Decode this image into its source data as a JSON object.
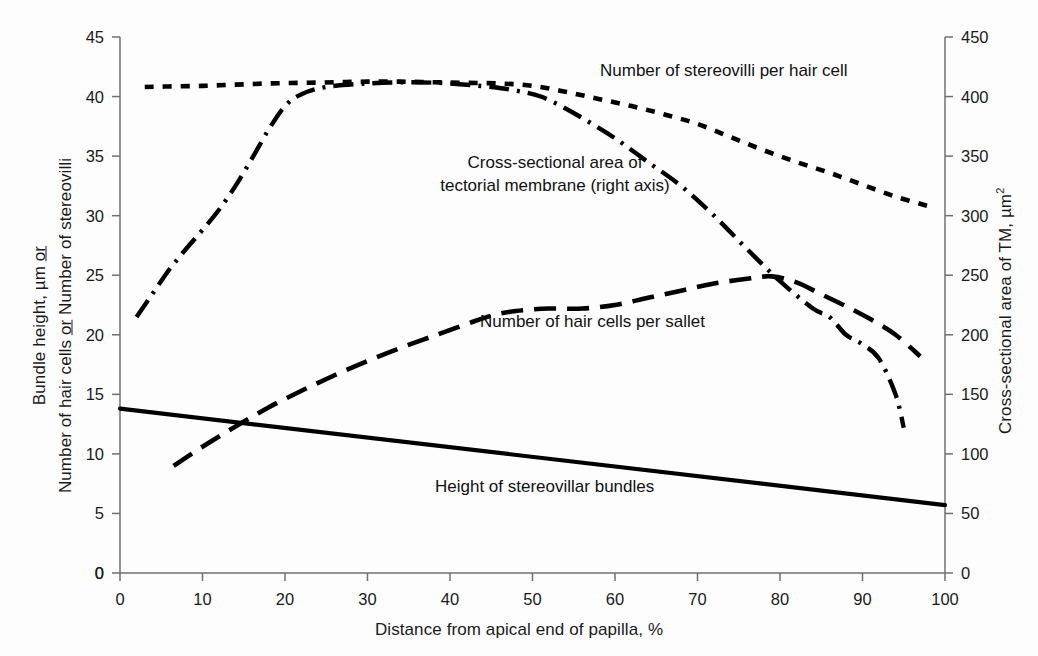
{
  "figure": {
    "background": "#fdfdfd",
    "ink": "#000000"
  },
  "axes": {
    "x": {
      "label": "Distance from apical end of papilla, %",
      "ticks": [
        0,
        10,
        20,
        30,
        40,
        50,
        60,
        70,
        80,
        90,
        100
      ],
      "min": 0,
      "max": 100
    },
    "y_left": {
      "label_line1": "Bundle height, µm ",
      "label_line1_or": "or",
      "label_line2": "Number of hair cells ",
      "label_line2_or": "or",
      "label_line2_tail": " Number of stereovilli",
      "ticks": [
        0,
        5,
        10,
        15,
        20,
        25,
        30,
        35,
        40,
        45
      ],
      "min": 0,
      "max": 45
    },
    "y_right": {
      "label_prefix": "Cross-sectional area of TM, µm",
      "label_sup": "2",
      "ticks": [
        0,
        50,
        100,
        150,
        200,
        250,
        300,
        350,
        400,
        450
      ],
      "min": 0,
      "max": 450
    }
  },
  "annotations": {
    "stereovilli": "Number of stereovilli per hair cell",
    "tm_line1": "Cross-sectional area of",
    "tm_line2": "tectorial membrane (right axis)",
    "hair_cells": "Number of hair cells per sallet",
    "bundles": "Height of stereovillar bundles"
  },
  "chart_data": {
    "type": "line",
    "title": "",
    "xlabel": "Distance from apical end of papilla, %",
    "ylabel": "Bundle height, µm or Number of hair cells or Number of stereovilli",
    "ylabel_right": "Cross-sectional area of TM, µm2",
    "xlim": [
      0,
      100
    ],
    "ylim": [
      0,
      45
    ],
    "ylim_right": [
      0,
      450
    ],
    "grid": false,
    "legend": "inline-annotations",
    "series": [
      {
        "name": "Number of stereovilli per hair cell",
        "axis": "left",
        "style": "dotted",
        "x": [
          3,
          6,
          10,
          14,
          18,
          22,
          26,
          30,
          34,
          38,
          42,
          46,
          50,
          54,
          58,
          62,
          66,
          70,
          74,
          78,
          82,
          86,
          90,
          94,
          98
        ],
        "y": [
          40.8,
          40.85,
          40.9,
          41.0,
          41.1,
          41.15,
          41.2,
          41.25,
          41.25,
          41.2,
          41.15,
          41.1,
          40.9,
          40.4,
          39.8,
          39.2,
          38.5,
          37.7,
          36.6,
          35.5,
          34.5,
          33.6,
          32.6,
          31.6,
          30.8
        ]
      },
      {
        "name": "Cross-sectional area of tectorial membrane",
        "axis": "right",
        "style": "dash-dot",
        "x": [
          2,
          4,
          6,
          8,
          10,
          12,
          14,
          16,
          18,
          20,
          22,
          25,
          30,
          35,
          40,
          45,
          48,
          51,
          54,
          57,
          60,
          64,
          68,
          72,
          76,
          80,
          84,
          86,
          88,
          90,
          92,
          94,
          95
        ],
        "y_right": [
          215,
          235,
          255,
          272,
          288,
          305,
          325,
          348,
          372,
          392,
          402,
          408,
          411,
          412,
          411,
          408,
          405,
          400,
          390,
          378,
          365,
          345,
          325,
          300,
          272,
          245,
          222,
          215,
          200,
          192,
          180,
          150,
          122
        ]
      },
      {
        "name": "Number of hair cells per sallet",
        "axis": "left",
        "style": "dashed",
        "x": [
          6.5,
          10,
          14,
          18,
          22,
          26,
          30,
          34,
          38,
          42,
          45,
          48,
          52,
          56,
          60,
          64,
          68,
          72,
          76,
          79,
          82,
          85,
          88,
          91,
          94,
          97
        ],
        "y": [
          9.0,
          10.6,
          12.3,
          13.9,
          15.3,
          16.6,
          17.8,
          18.9,
          19.9,
          20.9,
          21.6,
          22.0,
          22.2,
          22.2,
          22.5,
          23.1,
          23.7,
          24.3,
          24.7,
          24.9,
          24.4,
          23.4,
          22.4,
          21.3,
          20.0,
          18.2
        ]
      },
      {
        "name": "Height of stereovillar bundles",
        "axis": "left",
        "style": "solid",
        "x": [
          0,
          100
        ],
        "y": [
          13.8,
          5.7
        ]
      }
    ]
  }
}
